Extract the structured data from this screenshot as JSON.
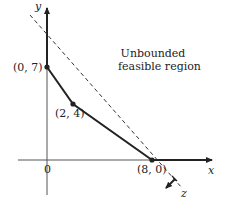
{
  "diagram": {
    "axes": {
      "x_label": "x",
      "y_label": "y",
      "origin_label": "0"
    },
    "points": [
      {
        "label": "(0, 7)",
        "x": 0,
        "y": 7
      },
      {
        "label": "(2, 4)",
        "x": 2,
        "y": 4
      },
      {
        "label": "(8, 0)",
        "x": 8,
        "y": 0
      }
    ],
    "region": {
      "line1": "Unbounded",
      "line2": "feasible region"
    },
    "objective": {
      "label": "z",
      "style": "dashed"
    },
    "colors": {
      "ink": "#222222",
      "axis": "#555555",
      "background": "#ffffff"
    }
  }
}
